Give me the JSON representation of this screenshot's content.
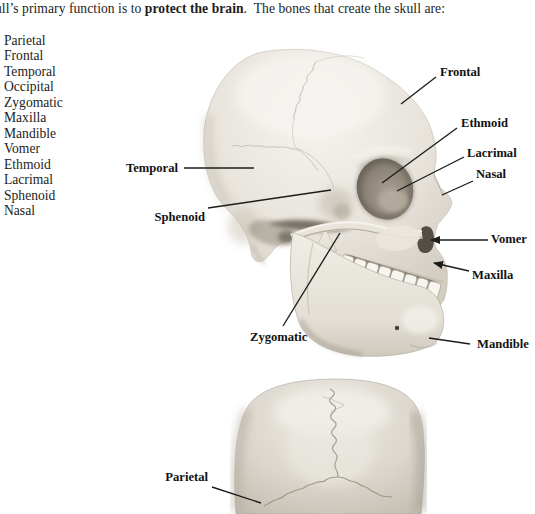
{
  "page": {
    "intro": {
      "prefix": "ull’s primary function is to ",
      "bold": "protect the brain",
      "suffix": ".  The bones that create the skull are:"
    },
    "bone_list": [
      "Parietal",
      "Frontal",
      "Temporal",
      "Occipital",
      "Zygomatic",
      "Maxilla",
      "Mandible",
      "Vomer",
      "Ethmoid",
      "Lacrimal",
      "Sphenoid",
      "Nasal"
    ],
    "figure1": {
      "description": "skull-anterolateral-view",
      "labels": {
        "frontal": "Frontal",
        "ethmoid": "Ethmoid",
        "lacrimal": "Lacrimal",
        "nasal": "Nasal",
        "vomer": "Vomer",
        "maxilla": "Maxilla",
        "mandible": "Mandible",
        "temporal": "Temporal",
        "sphenoid": "Sphenoid",
        "zygomatic": "Zygomatic"
      }
    },
    "figure2": {
      "description": "skull-posterior-view",
      "labels": {
        "parietal": "Parietal"
      }
    },
    "colors": {
      "bone_light": "#f4f2ee",
      "bone_mid": "#e2ded5",
      "bone_shadow": "#b5aea1",
      "orbit_dark": "#5f584e",
      "leader_line": "#1c1c1c",
      "text": "#1d1d1d"
    }
  }
}
